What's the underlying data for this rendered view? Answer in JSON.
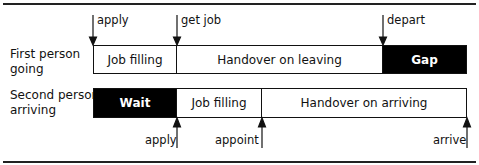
{
  "rows": [
    {
      "label_line1": "First person",
      "label_line2": "going",
      "segments": [
        {
          "label": "Job filling",
          "style": "light"
        },
        {
          "label": "Handover on leaving",
          "style": "light"
        },
        {
          "label": "Gap",
          "style": "dark"
        }
      ],
      "markers": [
        {
          "label": "apply",
          "direction": "down"
        },
        {
          "label": "get job",
          "direction": "down"
        },
        {
          "label": "depart",
          "direction": "down"
        }
      ]
    },
    {
      "label_line1": "Second person",
      "label_line2": "arriving",
      "segments": [
        {
          "label": "Wait",
          "style": "dark"
        },
        {
          "label": "Job filling",
          "style": "light"
        },
        {
          "label": "Handover on arriving",
          "style": "light"
        }
      ],
      "markers": [
        {
          "label": "apply",
          "direction": "up"
        },
        {
          "label": "appoint",
          "direction": "up"
        },
        {
          "label": "arrive",
          "direction": "up"
        }
      ]
    }
  ],
  "colors": {
    "dark_fill": "#000000",
    "light_fill": "#ffffff",
    "stroke": "#111111"
  }
}
